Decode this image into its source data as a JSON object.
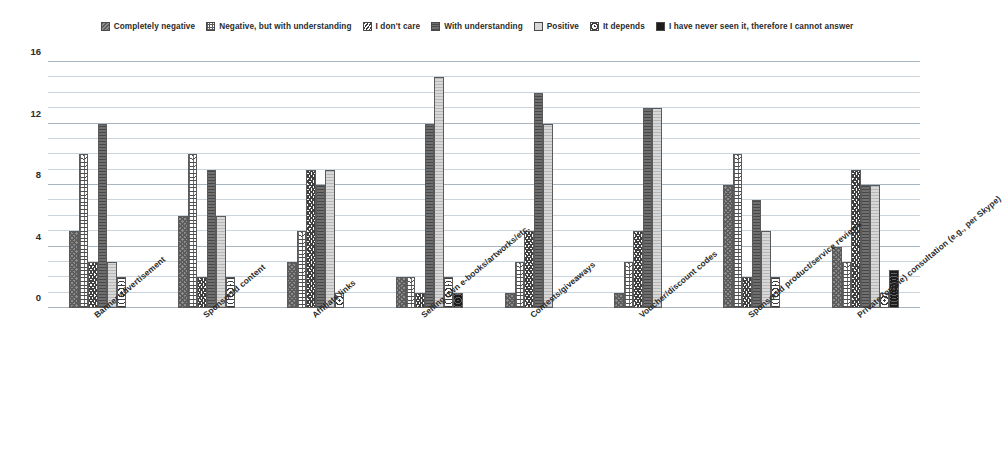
{
  "legend": {
    "items": [
      {
        "label": "Completely negative",
        "pattern": "p0",
        "icon": "hatch-diagonal-swatch"
      },
      {
        "label": "Negative, but with understanding",
        "pattern": "p1",
        "icon": "crosshatch-swatch"
      },
      {
        "label": "I don't care",
        "pattern": "p2",
        "icon": "zigzag-swatch"
      },
      {
        "label": "With understanding",
        "pattern": "p3",
        "icon": "dark-gray-swatch"
      },
      {
        "label": "Positive",
        "pattern": "p4",
        "icon": "light-gray-swatch"
      },
      {
        "label": "It depends",
        "pattern": "p5",
        "icon": "dotted-swatch"
      },
      {
        "label": "I have never seen it, therefore I cannot answer",
        "pattern": "p6",
        "icon": "black-swatch"
      }
    ]
  },
  "axis": {
    "y_ticks": [
      "0",
      "4",
      "8",
      "12",
      "16"
    ],
    "y_min": 0,
    "y_max": 16,
    "minor_step": 1
  },
  "colors": {
    "grid": "#c9d4dd",
    "grid_major": "#a8b6c2",
    "axis": "#3a3a3a",
    "text": "#2b2b2b",
    "series_dark_gray": "#6f6f6f",
    "series_light_gray": "#d8d8d8",
    "series_black": "#1c1c1c"
  },
  "chart_data": {
    "type": "bar",
    "title": "",
    "xlabel": "",
    "ylabel": "",
    "ylim": [
      0,
      16
    ],
    "grid": true,
    "legend_position": "top",
    "categories": [
      "Banner advertisement",
      "Sponsored content",
      "Affiliate links",
      "Selling own e-books/artworks/etc.",
      "Contests/giveaways",
      "Voucher/discount codes",
      "Sponsored product/service reviews",
      "Private (online) consultation (e.g., per Skype)"
    ],
    "series": [
      {
        "name": "Completely negative",
        "values": [
          5,
          6,
          3,
          2,
          1,
          1,
          8,
          4
        ]
      },
      {
        "name": "Negative, but with understanding",
        "values": [
          10,
          10,
          5,
          2,
          3,
          3,
          10,
          3
        ]
      },
      {
        "name": "I don't care",
        "values": [
          3,
          2,
          9,
          1,
          5,
          5,
          2,
          9
        ]
      },
      {
        "name": "With understanding",
        "values": [
          12,
          9,
          8,
          12,
          14,
          13,
          7,
          8
        ]
      },
      {
        "name": "Positive",
        "values": [
          3,
          6,
          9,
          15,
          12,
          13,
          5,
          8
        ]
      },
      {
        "name": "It depends",
        "values": [
          2,
          2,
          1,
          2,
          0,
          0,
          2,
          1
        ]
      },
      {
        "name": "I have never seen it, therefore I cannot answer",
        "values": [
          0,
          0,
          0,
          1,
          0,
          0,
          0,
          2.5
        ]
      }
    ]
  }
}
